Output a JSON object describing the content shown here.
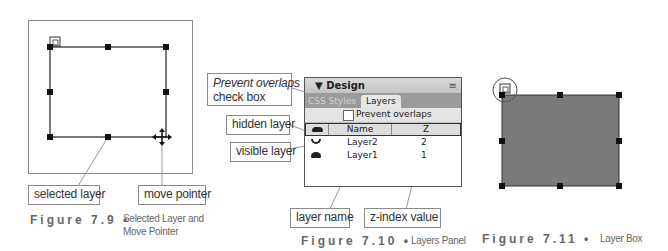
{
  "figures": [
    {
      "id": "7.9",
      "label": "Figure 7.9",
      "bullet": "•",
      "caption_line1": "Selected Layer and",
      "caption_line2": "Move Pointer",
      "callouts": {
        "selected_layer": "selected layer",
        "move_pointer": "move pointer"
      }
    },
    {
      "id": "7.10",
      "label": "Figure 7.10",
      "bullet": "•",
      "caption": "Layers Panel",
      "callouts": {
        "prevent_overlaps_line1": "Prevent overlaps",
        "prevent_overlaps_line2": "check box",
        "hidden_layer": "hidden layer",
        "visible_layer": "visible layer",
        "layer_name": "layer name",
        "z_index_value": "z-index value"
      },
      "panel": {
        "title": "▼ Design",
        "menu_icon": "≡",
        "tabs": [
          {
            "label": "CSS Styles",
            "active": false
          },
          {
            "label": "Layers",
            "active": true
          }
        ],
        "prevent_overlaps_label": "Prevent overlaps",
        "prevent_overlaps_checked": false,
        "columns": {
          "eye": "eye-icon",
          "name": "Name",
          "z": "Z"
        },
        "rows": [
          {
            "visibility": "hidden",
            "name": "Layer2",
            "z": "2"
          },
          {
            "visibility": "visible",
            "name": "Layer1",
            "z": "1"
          }
        ]
      }
    },
    {
      "id": "7.11",
      "label": "Figure 7.11",
      "bullet": "•",
      "caption": "Layer Box",
      "box_color": "#7a7a7a"
    }
  ]
}
